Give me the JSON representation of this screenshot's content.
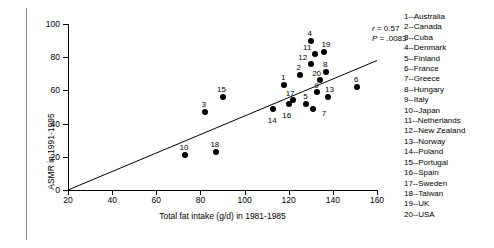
{
  "chart_data": {
    "type": "scatter",
    "title": "",
    "xlabel": "Total fat intake (g/d) in 1981-1985",
    "ylabel": "ASMR in 1991-1995",
    "xlim": [
      20,
      160
    ],
    "ylim": [
      0,
      100
    ],
    "xticks": [
      20,
      40,
      60,
      80,
      100,
      120,
      140,
      160
    ],
    "yticks": [
      0,
      20,
      40,
      60,
      80,
      100
    ],
    "grid": false,
    "legend_position": "right",
    "annotations": [
      {
        "text": "r = 0.57",
        "name": "correlation-annotation"
      },
      {
        "text": "P = .0083",
        "name": "pvalue-annotation"
      }
    ],
    "statistics": {
      "r": "0.57",
      "P": ".0083"
    },
    "trendline": {
      "type": "linear",
      "x": [
        20,
        160
      ],
      "y": [
        0,
        78
      ]
    },
    "points": [
      {
        "id": "1",
        "label": "Australia",
        "x": 118,
        "y": 63
      },
      {
        "id": "2",
        "label": "Canada",
        "x": 125,
        "y": 69
      },
      {
        "id": "3",
        "label": "Cuba",
        "x": 82,
        "y": 47
      },
      {
        "id": "4",
        "label": "Denmark",
        "x": 130,
        "y": 90
      },
      {
        "id": "5",
        "label": "Finland",
        "x": 128,
        "y": 52
      },
      {
        "id": "6",
        "label": "France",
        "x": 151,
        "y": 62
      },
      {
        "id": "7",
        "label": "Greece",
        "x": 131,
        "y": 49
      },
      {
        "id": "8",
        "label": "Hungary",
        "x": 137,
        "y": 71
      },
      {
        "id": "9",
        "label": "Italy",
        "x": 133,
        "y": 59
      },
      {
        "id": "10",
        "label": "Japan",
        "x": 73,
        "y": 21
      },
      {
        "id": "11",
        "label": "Netherlands",
        "x": 132,
        "y": 82
      },
      {
        "id": "12",
        "label": "New Zealand",
        "x": 130,
        "y": 76
      },
      {
        "id": "13",
        "label": "Norway",
        "x": 138,
        "y": 56
      },
      {
        "id": "14",
        "label": "Poland",
        "x": 113,
        "y": 49
      },
      {
        "id": "15",
        "label": "Portugal",
        "x": 90,
        "y": 56
      },
      {
        "id": "16",
        "label": "Spain",
        "x": 120,
        "y": 52
      },
      {
        "id": "17",
        "label": "Sweden",
        "x": 122,
        "y": 54
      },
      {
        "id": "18",
        "label": "Taiwan",
        "x": 87,
        "y": 23
      },
      {
        "id": "19",
        "label": "UK",
        "x": 136,
        "y": 83
      },
      {
        "id": "20",
        "label": "USA",
        "x": 134,
        "y": 66
      }
    ]
  },
  "legend": {
    "entries": [
      "1--Australia",
      "2--Canada",
      "3--Cuba",
      "4--Denmark",
      "5--Finland",
      "6--France",
      "7--Greece",
      "8--Hungary",
      "9--Italy",
      "10--Japan",
      "11--Netherlands",
      "12--New Zealand",
      "13--Norway",
      "14--Poland",
      "15--Portugal",
      "16--Spain",
      "17--Sweden",
      "18--Taiwan",
      "19--UK",
      "20--USA"
    ]
  },
  "colors": {
    "marker": "#000000",
    "axis": "#000000",
    "background": "#ffffff"
  }
}
